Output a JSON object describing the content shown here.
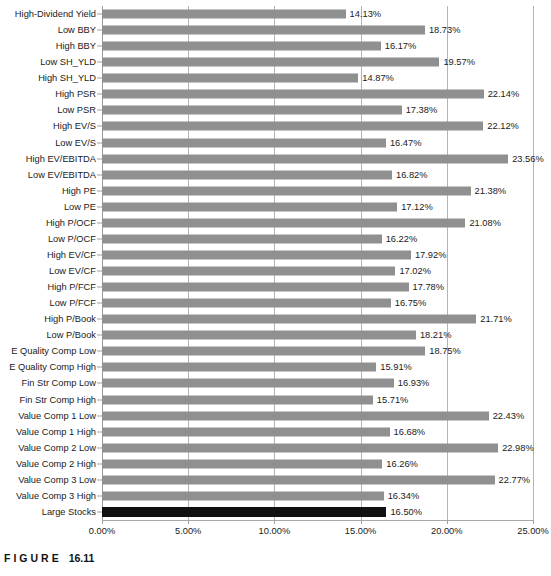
{
  "caption": {
    "word": "FIGURE",
    "number": "16.11"
  },
  "chart_data": {
    "type": "bar",
    "orientation": "horizontal",
    "title": "",
    "subtitle": "",
    "xlabel": "",
    "ylabel": "",
    "xlim": [
      0,
      25
    ],
    "xtick_labels": [
      "0.00%",
      "5.00%",
      "10.00%",
      "15.00%",
      "20.00%",
      "25.00%"
    ],
    "xtick_values": [
      0,
      5,
      10,
      15,
      20,
      25
    ],
    "grid": true,
    "legend": "none",
    "value_suffix": "%",
    "bar_color": "#909090",
    "highlight_color": "#111111",
    "highlight_category": "Large Stocks",
    "categories": [
      "High-Dividend Yield",
      "Low BBY",
      "High BBY",
      "Low SH_YLD",
      "High SH_YLD",
      "High PSR",
      "Low PSR",
      "High EV/S",
      "Low EV/S",
      "High EV/EBITDA",
      "Low EV/EBITDA",
      "High PE",
      "Low PE",
      "High P/OCF",
      "Low P/OCF",
      "High EV/CF",
      "Low EV/CF",
      "High P/FCF",
      "Low P/FCF",
      "High P/Book",
      "Low P/Book",
      "E Quality Comp Low",
      "E Quality Comp High",
      "Fin Str Comp Low",
      "Fin Str Comp High",
      "Value Comp 1 Low",
      "Value Comp 1 High",
      "Value Comp 2 Low",
      "Value Comp 2 High",
      "Value Comp 3 Low",
      "Value Comp 3 High",
      "Large Stocks"
    ],
    "values": [
      14.13,
      18.73,
      16.17,
      19.57,
      14.87,
      22.14,
      17.38,
      22.12,
      16.47,
      23.56,
      16.82,
      21.38,
      17.12,
      21.08,
      16.22,
      17.92,
      17.02,
      17.78,
      16.75,
      21.71,
      18.21,
      18.75,
      15.91,
      16.93,
      15.71,
      22.43,
      16.68,
      22.98,
      16.26,
      22.77,
      16.34,
      16.5
    ],
    "value_labels": [
      "14.13%",
      "18.73%",
      "16.17%",
      "19.57%",
      "14.87%",
      "22.14%",
      "17.38%",
      "22.12%",
      "16.47%",
      "23.56%",
      "16.82%",
      "21.38%",
      "17.12%",
      "21.08%",
      "16.22%",
      "17.92%",
      "17.02%",
      "17.78%",
      "16.75%",
      "21.71%",
      "18.21%",
      "18.75%",
      "15.91%",
      "16.93%",
      "15.71%",
      "22.43%",
      "16.68%",
      "22.98%",
      "16.26%",
      "22.77%",
      "16.34%",
      "16.50%"
    ]
  }
}
